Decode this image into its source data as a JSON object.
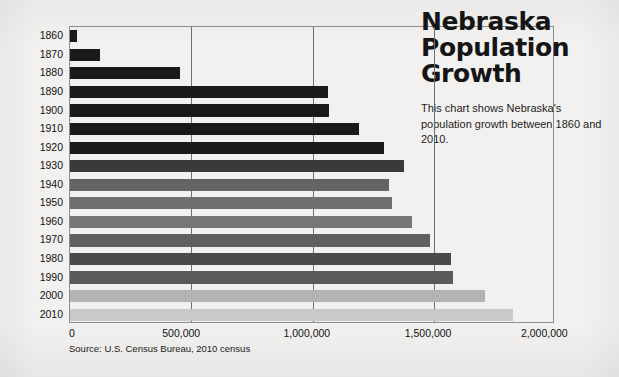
{
  "title": "Nebraska\nPopulation\nGrowth",
  "subtitle": "This chart shows Nebraska's population growth between 1860 and 2010.",
  "source_note": "Source: U.S. Census Bureau, 2010 census",
  "background_color": "#f2f1ef",
  "gridline_color": "#6f6f6f",
  "axis_color": "#8e8e8e",
  "chart_data": {
    "type": "bar",
    "orientation": "horizontal",
    "title": "Nebraska Population Growth",
    "subtitle": "This chart shows Nebraska's population growth between 1860 and 2010.",
    "xlabel": "",
    "ylabel": "",
    "xlim": [
      0,
      2000000
    ],
    "xticks": [
      0,
      500000,
      1000000,
      1500000,
      2000000
    ],
    "xtick_labels": [
      "0",
      "500,000",
      "1,000,000",
      "1,500,000",
      "2,000,000"
    ],
    "grid": true,
    "grid_axis": "x",
    "legend": false,
    "source": "Source: U.S. Census Bureau, 2010 census",
    "categories": [
      "1860",
      "1870",
      "1880",
      "1890",
      "1900",
      "1910",
      "1920",
      "1930",
      "1940",
      "1950",
      "1960",
      "1970",
      "1980",
      "1990",
      "2000",
      "2010"
    ],
    "values": [
      28800,
      123000,
      452000,
      1063000,
      1066000,
      1192000,
      1296000,
      1378000,
      1316000,
      1326000,
      1411000,
      1485000,
      1570000,
      1578000,
      1711000,
      1826000
    ],
    "bar_colors": [
      "#1a1a1a",
      "#1a1a1a",
      "#1a1a1a",
      "#1a1a1a",
      "#1a1a1a",
      "#1a1a1a",
      "#1a1a1a",
      "#3a3a3a",
      "#646464",
      "#6f6f6f",
      "#767676",
      "#606060",
      "#4a4a4a",
      "#5a5a5a",
      "#b3b3b3",
      "#c9c9c9"
    ]
  },
  "axis": {
    "y_labels": [
      "1860",
      "1870",
      "1880",
      "1890",
      "1900",
      "1910",
      "1920",
      "1930",
      "1940",
      "1950",
      "1960",
      "1970",
      "1980",
      "1990",
      "2000",
      "2010"
    ],
    "x_labels": [
      "0",
      "500,000",
      "1,000,000",
      "1,500,000",
      "2,000,000"
    ]
  }
}
